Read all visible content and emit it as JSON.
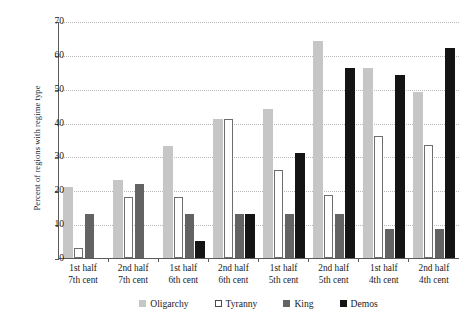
{
  "chart_data": {
    "type": "bar",
    "title": "",
    "xlabel": "",
    "ylabel": "Percent of regions with regime type",
    "ylim": [
      0,
      70
    ],
    "ytick_labels": [
      "70",
      "60",
      "50",
      "40",
      "30",
      "20",
      "10",
      "0"
    ],
    "ytick_values": [
      70,
      60,
      50,
      40,
      30,
      20,
      10,
      0
    ],
    "grid": true,
    "legend_position": "bottom-center",
    "categories": [
      "1st half 7th cent",
      "2nd half 7th cent",
      "1st half 6th cent",
      "2nd half 6th cent",
      "1st half 5th cent",
      "2nd half 5th cent",
      "1st half 4th cent",
      "2nd half 4th cent"
    ],
    "category_lines": [
      [
        "1st half",
        "7th cent"
      ],
      [
        "2nd half",
        "7th cent"
      ],
      [
        "1st half",
        "6th cent"
      ],
      [
        "2nd half",
        "6th cent"
      ],
      [
        "1st half",
        "5th cent"
      ],
      [
        "2nd half",
        "5th cent"
      ],
      [
        "1st half",
        "4th cent"
      ],
      [
        "2nd half",
        "4th cent"
      ]
    ],
    "series": [
      {
        "name": "Oligarchy",
        "color": "#c6c6c6",
        "values": [
          21,
          23,
          33,
          41,
          44,
          64,
          56,
          49
        ]
      },
      {
        "name": "Tyranny",
        "color": "#ffffff",
        "values": [
          3,
          18,
          18,
          41,
          26,
          18.5,
          36,
          33.5
        ]
      },
      {
        "name": "King",
        "color": "#636363",
        "values": [
          13,
          22,
          13,
          13,
          13,
          13,
          8.5,
          8.5
        ]
      },
      {
        "name": "Demos",
        "color": "#141414",
        "values": [
          0,
          0,
          5,
          13,
          31,
          56,
          54,
          62
        ]
      }
    ]
  }
}
